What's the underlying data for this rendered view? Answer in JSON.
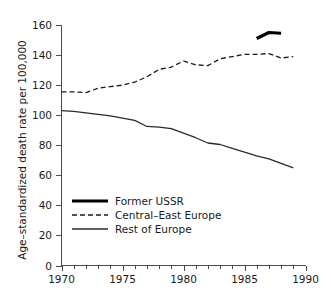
{
  "chart_data": {
    "type": "line",
    "title": "",
    "xlabel": "",
    "ylabel": "Age–standardized death rate per 100,000",
    "xlim": [
      1970,
      1990
    ],
    "ylim": [
      0,
      160
    ],
    "grid": false,
    "legend_position": "inside-lower-left",
    "x_ticks": [
      1970,
      1975,
      1980,
      1985,
      1990
    ],
    "x_tick_labels": [
      "1970",
      "1975",
      "1980",
      "1985",
      "1990"
    ],
    "x_minor_tick_interval": 1,
    "y_ticks": [
      0,
      20,
      40,
      60,
      80,
      100,
      120,
      140,
      160
    ],
    "y_tick_labels": [
      "0",
      "20",
      "40",
      "60",
      "80",
      "100",
      "120",
      "140",
      "160"
    ],
    "series": [
      {
        "name": "Former USSR",
        "style": "solid-thick",
        "color": "#000000",
        "x": [
          1986,
          1987,
          1988
        ],
        "values": [
          151.0,
          155.0,
          154.5
        ]
      },
      {
        "name": "Central–East Europe",
        "style": "dashed",
        "color": "#1a1a1a",
        "x": [
          1970,
          1971,
          1972,
          1973,
          1974,
          1975,
          1976,
          1977,
          1978,
          1979,
          1980,
          1981,
          1982,
          1983,
          1984,
          1985,
          1986,
          1987,
          1988,
          1989
        ],
        "values": [
          115.5,
          115.5,
          115.0,
          118.0,
          119.0,
          120.0,
          122.0,
          125.5,
          130.5,
          132.0,
          136.0,
          133.5,
          133.0,
          137.5,
          139.0,
          140.5,
          140.5,
          141.0,
          138.0,
          139.0
        ]
      },
      {
        "name": "Rest of Europe",
        "style": "solid-thin",
        "color": "#2a2a2a",
        "x": [
          1970,
          1971,
          1972,
          1973,
          1974,
          1975,
          1976,
          1977,
          1978,
          1979,
          1980,
          1981,
          1982,
          1983,
          1984,
          1985,
          1986,
          1987,
          1988,
          1989
        ],
        "values": [
          103.0,
          102.5,
          101.5,
          100.5,
          99.5,
          98.0,
          96.5,
          92.5,
          92.0,
          91.0,
          88.0,
          85.0,
          81.5,
          80.5,
          78.0,
          75.5,
          73.0,
          71.0,
          68.0,
          65.0
        ]
      }
    ]
  },
  "legend": {
    "items": [
      {
        "label": "Former USSR"
      },
      {
        "label": "Central–East Europe"
      },
      {
        "label": "Rest of Europe"
      }
    ]
  }
}
